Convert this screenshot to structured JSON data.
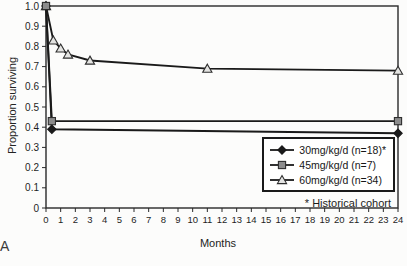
{
  "figure": {
    "panel_label": "A",
    "background": "#fcfcfb"
  },
  "chart_data": {
    "type": "line",
    "title": "",
    "xlabel": "Months",
    "ylabel": "Proportion surviving",
    "xlim": [
      0,
      24
    ],
    "ylim": [
      0,
      1.0
    ],
    "grid": false,
    "legend_position": "bottom-right",
    "footnote": "* Historical cohort",
    "axis_color": "#2a2a2a",
    "x_tick_values": [
      0,
      1,
      2,
      3,
      4,
      5,
      6,
      7,
      8,
      9,
      10,
      11,
      12,
      13,
      14,
      15,
      16,
      17,
      18,
      19,
      20,
      21,
      22,
      23,
      24
    ],
    "x_tick_labels": [
      "0",
      "1",
      "2",
      "3",
      "4",
      "5",
      "6",
      "7",
      "8",
      "9",
      "10",
      "11",
      "12",
      "13",
      "14",
      "15",
      "16",
      "17",
      "18",
      "19",
      "20",
      "21",
      "22",
      "23",
      "24"
    ],
    "y_tick_values": [
      0,
      0.1,
      0.2,
      0.3,
      0.4,
      0.5,
      0.6,
      0.7,
      0.8,
      0.9,
      1.0
    ],
    "y_tick_labels": [
      "0",
      "0.1",
      "0.2",
      "0.3",
      "0.4",
      "0.5",
      "0.6",
      "0.7",
      "0.8",
      "0.9",
      "1.0"
    ],
    "series": [
      {
        "name": "30mg/kg/d (n=18)*",
        "marker": "diamond",
        "line_color": "#1a1a1a",
        "marker_fill": "#1a1a1a",
        "marker_stroke": "#1a1a1a",
        "x": [
          0,
          0.4,
          24
        ],
        "y": [
          1.0,
          0.39,
          0.37
        ]
      },
      {
        "name": "45mg/kg/d (n=7)",
        "marker": "square",
        "line_color": "#1a1a1a",
        "marker_fill": "#8c8c8c",
        "marker_stroke": "#2e2e2e",
        "x": [
          0,
          0.4,
          24
        ],
        "y": [
          1.0,
          0.43,
          0.43
        ]
      },
      {
        "name": "60mg/kg/d (n=34)",
        "marker": "triangle",
        "line_color": "#1a1a1a",
        "marker_fill": "#e4e4e2",
        "marker_stroke": "#2e2e2e",
        "x": [
          0,
          0.5,
          1,
          1.5,
          3,
          11,
          24
        ],
        "y": [
          1.0,
          0.83,
          0.79,
          0.76,
          0.73,
          0.69,
          0.68
        ]
      }
    ]
  }
}
